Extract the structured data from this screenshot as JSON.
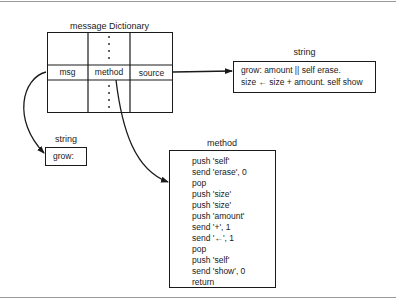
{
  "diagram": {
    "dictionary": {
      "title": "message Dictionary",
      "columns": [
        "msg",
        "method",
        "source"
      ],
      "ellipsis": "⋮"
    },
    "source_string": {
      "label": "string",
      "lines": [
        "grow: amount || self erase.",
        "size ← size + amount. self show"
      ]
    },
    "msg_string": {
      "label": "string",
      "value": "grow:"
    },
    "method": {
      "label": "method",
      "lines": [
        "push 'self'",
        "send 'erase', 0",
        "pop",
        "push 'size'",
        "push 'size'",
        "push 'amount'",
        "send '+', 1",
        "send '←', 1",
        "pop",
        "push 'self'",
        "send 'show', 0",
        "return"
      ]
    },
    "colors": {
      "line": "#1a1a1a",
      "rule": "#9a9a9a",
      "background": "#ffffff"
    }
  }
}
